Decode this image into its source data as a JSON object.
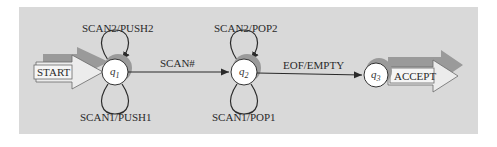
{
  "diagram": {
    "type": "state-machine",
    "states": [
      {
        "id": "q1",
        "label": "q",
        "sub": "1"
      },
      {
        "id": "q2",
        "label": "q",
        "sub": "2"
      },
      {
        "id": "q3",
        "label": "q",
        "sub": "3"
      }
    ],
    "start_label": "START",
    "accept_label": "ACCEPT",
    "transitions": {
      "q1_self_top": "SCAN2/PUSH2",
      "q1_self_bottom": "SCAN1/PUSH1",
      "q1_to_q2": "SCAN#",
      "q2_self_top": "SCAN2/POP2",
      "q2_self_bottom": "SCAN1/POP1",
      "q2_to_q3": "EOF/EMPTY"
    },
    "colors": {
      "panel": "#d9d9d9",
      "shadow": "#9a9a9a",
      "arrow_fill": "#ececec",
      "line": "#2a2a2a"
    }
  }
}
